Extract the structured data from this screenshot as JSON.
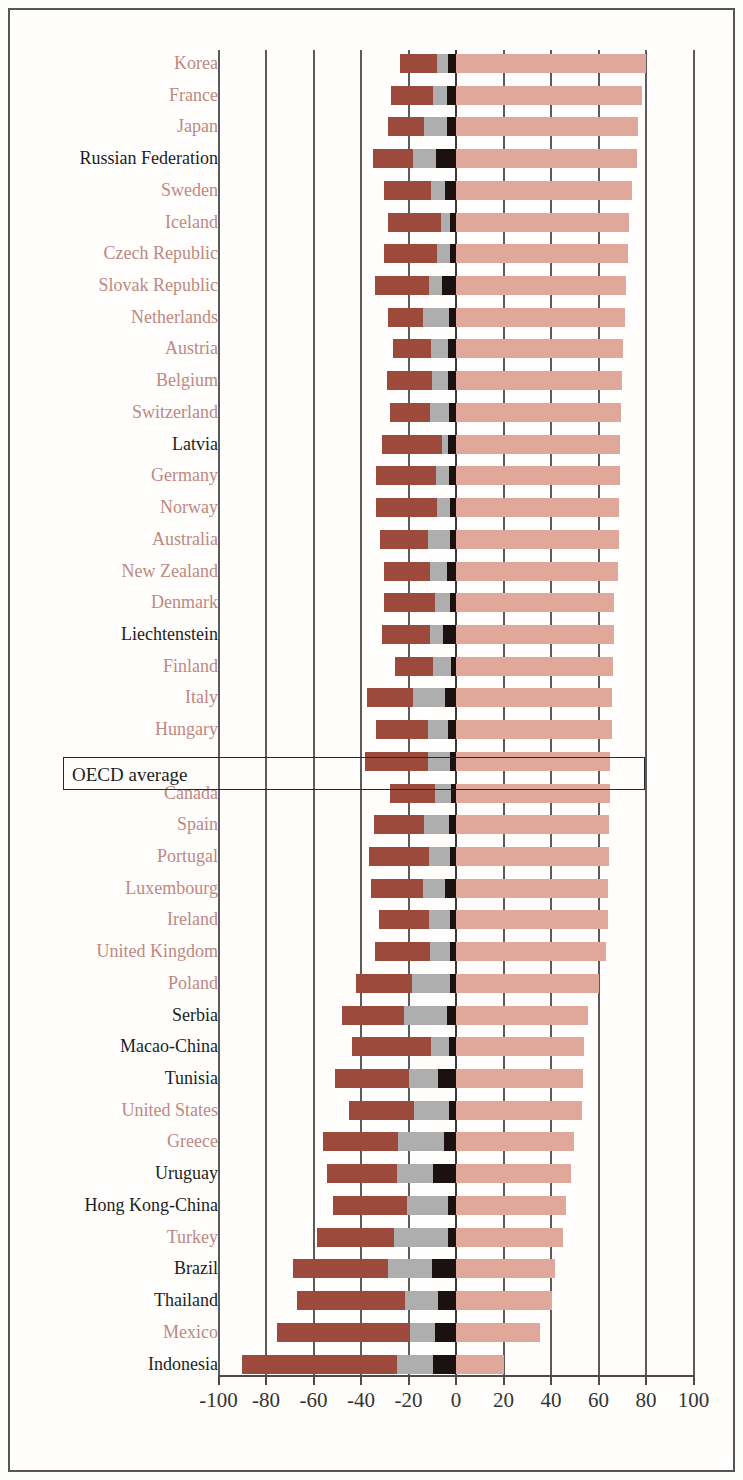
{
  "chart_data": {
    "type": "bar",
    "orientation": "horizontal",
    "stacked": true,
    "diverging": true,
    "title": "",
    "subtitle": "",
    "xlabel": "",
    "ylabel": "",
    "xlim": [
      -100,
      100
    ],
    "xticks": [
      -100,
      -80,
      -60,
      -40,
      -20,
      0,
      20,
      40,
      60,
      80,
      100
    ],
    "xtick_labels": [
      "-100",
      "-80",
      "-60",
      "-40",
      "-20",
      "0",
      "20",
      "40",
      "60",
      "80",
      "100"
    ],
    "grid": true,
    "grid_axis": "x",
    "legend": [],
    "series": [
      {
        "name": "negative-outer",
        "color": "#9c4a3b"
      },
      {
        "name": "negative-mid",
        "color": "#aeaeae"
      },
      {
        "name": "negative-inner",
        "color": "#1b1110"
      },
      {
        "name": "positive",
        "color": "#dfa89b"
      }
    ],
    "highlight": {
      "label": "OECD average",
      "boxed": true
    },
    "label_colors": {
      "oecd_member": "#c08880",
      "non_member": "#1d1d1d"
    },
    "categories": [
      "Korea",
      "France",
      "Japan",
      "Russian Federation",
      "Sweden",
      "Iceland",
      "Czech Republic",
      "Slovak Republic",
      "Netherlands",
      "Austria",
      "Belgium",
      "Switzerland",
      "Latvia",
      "Germany",
      "Norway",
      "Australia",
      "New Zealand",
      "Denmark",
      "Liechtenstein",
      "Finland",
      "Italy",
      "Hungary",
      "OECD average",
      "Canada",
      "Spain",
      "Portugal",
      "Luxembourg",
      "Ireland",
      "United Kingdom",
      "Poland",
      "Serbia",
      "Macao-China",
      "Tunisia",
      "United States",
      "Greece",
      "Uruguay",
      "Hong Kong-China",
      "Turkey",
      "Brazil",
      "Thailand",
      "Mexico",
      "Indonesia"
    ],
    "rows": [
      {
        "label": "Korea",
        "member": true,
        "neg_outer": [
          -23.5,
          -8.0
        ],
        "neg_mid": [
          -8.0,
          -3.5
        ],
        "neg_inner": [
          -3.5,
          0
        ],
        "pos": 80.0
      },
      {
        "label": "France",
        "member": true,
        "neg_outer": [
          -27.5,
          -9.5
        ],
        "neg_mid": [
          -9.5,
          -4.0
        ],
        "neg_inner": [
          -4.0,
          0
        ],
        "pos": 78.5
      },
      {
        "label": "Japan",
        "member": true,
        "neg_outer": [
          -28.5,
          -13.5
        ],
        "neg_mid": [
          -13.5,
          -4.0
        ],
        "neg_inner": [
          -4.0,
          0
        ],
        "pos": 76.5
      },
      {
        "label": "Russian Federation",
        "member": false,
        "neg_outer": [
          -35.0,
          -18.0
        ],
        "neg_mid": [
          -18.0,
          -8.5
        ],
        "neg_inner": [
          -8.5,
          0
        ],
        "pos": 76.0
      },
      {
        "label": "Sweden",
        "member": true,
        "neg_outer": [
          -30.5,
          -10.5
        ],
        "neg_mid": [
          -10.5,
          -4.5
        ],
        "neg_inner": [
          -4.5,
          0
        ],
        "pos": 74.0
      },
      {
        "label": "Iceland",
        "member": true,
        "neg_outer": [
          -28.5,
          -6.5
        ],
        "neg_mid": [
          -6.5,
          -2.5
        ],
        "neg_inner": [
          -2.5,
          0
        ],
        "pos": 73.0
      },
      {
        "label": "Czech Republic",
        "member": true,
        "neg_outer": [
          -30.5,
          -8.0
        ],
        "neg_mid": [
          -8.0,
          -2.5
        ],
        "neg_inner": [
          -2.5,
          0
        ],
        "pos": 72.5
      },
      {
        "label": "Slovak Republic",
        "member": true,
        "neg_outer": [
          -34.0,
          -11.5
        ],
        "neg_mid": [
          -11.5,
          -6.0
        ],
        "neg_inner": [
          -6.0,
          0
        ],
        "pos": 71.5
      },
      {
        "label": "Netherlands",
        "member": true,
        "neg_outer": [
          -28.5,
          -14.0
        ],
        "neg_mid": [
          -14.0,
          -3.0
        ],
        "neg_inner": [
          -3.0,
          0
        ],
        "pos": 71.0
      },
      {
        "label": "Austria",
        "member": true,
        "neg_outer": [
          -26.5,
          -10.5
        ],
        "neg_mid": [
          -10.5,
          -3.5
        ],
        "neg_inner": [
          -3.5,
          0
        ],
        "pos": 70.5
      },
      {
        "label": "Belgium",
        "member": true,
        "neg_outer": [
          -29.0,
          -10.0
        ],
        "neg_mid": [
          -10.0,
          -3.5
        ],
        "neg_inner": [
          -3.5,
          0
        ],
        "pos": 70.0
      },
      {
        "label": "Switzerland",
        "member": true,
        "neg_outer": [
          -28.0,
          -11.0
        ],
        "neg_mid": [
          -11.0,
          -3.0
        ],
        "neg_inner": [
          -3.0,
          0
        ],
        "pos": 69.5
      },
      {
        "label": "Latvia",
        "member": false,
        "neg_outer": [
          -31.0,
          -6.0
        ],
        "neg_mid": [
          -6.0,
          -3.5
        ],
        "neg_inner": [
          -3.5,
          0
        ],
        "pos": 69.0
      },
      {
        "label": "Germany",
        "member": true,
        "neg_outer": [
          -33.5,
          -8.5
        ],
        "neg_mid": [
          -8.5,
          -3.0
        ],
        "neg_inner": [
          -3.0,
          0
        ],
        "pos": 69.0
      },
      {
        "label": "Norway",
        "member": true,
        "neg_outer": [
          -33.5,
          -8.0
        ],
        "neg_mid": [
          -8.0,
          -2.5
        ],
        "neg_inner": [
          -2.5,
          0
        ],
        "pos": 68.5
      },
      {
        "label": "Australia",
        "member": true,
        "neg_outer": [
          -32.0,
          -12.0
        ],
        "neg_mid": [
          -12.0,
          -2.5
        ],
        "neg_inner": [
          -2.5,
          0
        ],
        "pos": 68.5
      },
      {
        "label": "New Zealand",
        "member": true,
        "neg_outer": [
          -30.5,
          -11.0
        ],
        "neg_mid": [
          -11.0,
          -4.0
        ],
        "neg_inner": [
          -4.0,
          0
        ],
        "pos": 68.0
      },
      {
        "label": "Denmark",
        "member": true,
        "neg_outer": [
          -30.5,
          -9.0
        ],
        "neg_mid": [
          -9.0,
          -2.5
        ],
        "neg_inner": [
          -2.5,
          0
        ],
        "pos": 66.5
      },
      {
        "label": "Liechtenstein",
        "member": false,
        "neg_outer": [
          -31.0,
          -11.0
        ],
        "neg_mid": [
          -11.0,
          -5.5
        ],
        "neg_inner": [
          -5.5,
          0
        ],
        "pos": 66.5
      },
      {
        "label": "Finland",
        "member": true,
        "neg_outer": [
          -25.5,
          -9.5
        ],
        "neg_mid": [
          -9.5,
          -2.0
        ],
        "neg_inner": [
          -2.0,
          0
        ],
        "pos": 66.0
      },
      {
        "label": "Italy",
        "member": true,
        "neg_outer": [
          -37.5,
          -18.0
        ],
        "neg_mid": [
          -18.0,
          -4.5
        ],
        "neg_inner": [
          -4.5,
          0
        ],
        "pos": 65.5
      },
      {
        "label": "Hungary",
        "member": true,
        "neg_outer": [
          -33.5,
          -12.0
        ],
        "neg_mid": [
          -12.0,
          -3.5
        ],
        "neg_inner": [
          -3.5,
          0
        ],
        "pos": 65.5
      },
      {
        "label": "OECD average",
        "member": null,
        "neg_outer": [
          -38.5,
          -12.0
        ],
        "neg_mid": [
          -12.0,
          -2.5
        ],
        "neg_inner": [
          -2.5,
          0
        ],
        "pos": 65.0
      },
      {
        "label": "Canada",
        "member": true,
        "neg_outer": [
          -28.0,
          -9.0
        ],
        "neg_mid": [
          -9.0,
          -2.0
        ],
        "neg_inner": [
          -2.0,
          0
        ],
        "pos": 65.0
      },
      {
        "label": "Spain",
        "member": true,
        "neg_outer": [
          -34.5,
          -13.5
        ],
        "neg_mid": [
          -13.5,
          -3.0
        ],
        "neg_inner": [
          -3.0,
          0
        ],
        "pos": 64.5
      },
      {
        "label": "Portugal",
        "member": true,
        "neg_outer": [
          -36.5,
          -11.5
        ],
        "neg_mid": [
          -11.5,
          -2.5
        ],
        "neg_inner": [
          -2.5,
          0
        ],
        "pos": 64.5
      },
      {
        "label": "Luxembourg",
        "member": true,
        "neg_outer": [
          -36.0,
          -14.0
        ],
        "neg_mid": [
          -14.0,
          -4.5
        ],
        "neg_inner": [
          -4.5,
          0
        ],
        "pos": 64.0
      },
      {
        "label": "Ireland",
        "member": true,
        "neg_outer": [
          -32.5,
          -11.5
        ],
        "neg_mid": [
          -11.5,
          -2.5
        ],
        "neg_inner": [
          -2.5,
          0
        ],
        "pos": 64.0
      },
      {
        "label": "United Kingdom",
        "member": true,
        "neg_outer": [
          -34.0,
          -11.0
        ],
        "neg_mid": [
          -11.0,
          -2.5
        ],
        "neg_inner": [
          -2.5,
          0
        ],
        "pos": 63.0
      },
      {
        "label": "Poland",
        "member": true,
        "neg_outer": [
          -42.0,
          -18.5
        ],
        "neg_mid": [
          -18.5,
          -2.5
        ],
        "neg_inner": [
          -2.5,
          0
        ],
        "pos": 60.0
      },
      {
        "label": "Serbia",
        "member": false,
        "neg_outer": [
          -48.0,
          -22.0
        ],
        "neg_mid": [
          -22.0,
          -4.0
        ],
        "neg_inner": [
          -4.0,
          0
        ],
        "pos": 55.5
      },
      {
        "label": "Macao-China",
        "member": false,
        "neg_outer": [
          -44.0,
          -10.5
        ],
        "neg_mid": [
          -10.5,
          -3.0
        ],
        "neg_inner": [
          -3.0,
          0
        ],
        "pos": 54.0
      },
      {
        "label": "Tunisia",
        "member": false,
        "neg_outer": [
          -51.0,
          -20.0
        ],
        "neg_mid": [
          -20.0,
          -7.5
        ],
        "neg_inner": [
          -7.5,
          0
        ],
        "pos": 53.5
      },
      {
        "label": "United States",
        "member": true,
        "neg_outer": [
          -45.0,
          -17.5
        ],
        "neg_mid": [
          -17.5,
          -3.0
        ],
        "neg_inner": [
          -3.0,
          0
        ],
        "pos": 53.0
      },
      {
        "label": "Greece",
        "member": true,
        "neg_outer": [
          -56.0,
          -24.5
        ],
        "neg_mid": [
          -24.5,
          -5.0
        ],
        "neg_inner": [
          -5.0,
          0
        ],
        "pos": 49.5
      },
      {
        "label": "Uruguay",
        "member": false,
        "neg_outer": [
          -54.5,
          -25.0
        ],
        "neg_mid": [
          -25.0,
          -9.5
        ],
        "neg_inner": [
          -9.5,
          0
        ],
        "pos": 48.5
      },
      {
        "label": "Hong Kong-China",
        "member": false,
        "neg_outer": [
          -52.0,
          -20.5
        ],
        "neg_mid": [
          -20.5,
          -3.5
        ],
        "neg_inner": [
          -3.5,
          0
        ],
        "pos": 46.5
      },
      {
        "label": "Turkey",
        "member": true,
        "neg_outer": [
          -58.5,
          -26.0
        ],
        "neg_mid": [
          -26.0,
          -3.5
        ],
        "neg_inner": [
          -3.5,
          0
        ],
        "pos": 45.0
      },
      {
        "label": "Brazil",
        "member": false,
        "neg_outer": [
          -68.5,
          -28.5
        ],
        "neg_mid": [
          -28.5,
          -10.0
        ],
        "neg_inner": [
          -10.0,
          0
        ],
        "pos": 41.5
      },
      {
        "label": "Thailand",
        "member": false,
        "neg_outer": [
          -67.0,
          -21.5
        ],
        "neg_mid": [
          -21.5,
          -7.5
        ],
        "neg_inner": [
          -7.5,
          0
        ],
        "pos": 40.5
      },
      {
        "label": "Mexico",
        "member": true,
        "neg_outer": [
          -75.5,
          -19.5
        ],
        "neg_mid": [
          -19.5,
          -9.0
        ],
        "neg_inner": [
          -9.0,
          0
        ],
        "pos": 35.5
      },
      {
        "label": "Indonesia",
        "member": false,
        "neg_outer": [
          -90.0,
          -25.0
        ],
        "neg_mid": [
          -25.0,
          -9.5
        ],
        "neg_inner": [
          -9.5,
          0
        ],
        "pos": 20.0
      }
    ]
  }
}
